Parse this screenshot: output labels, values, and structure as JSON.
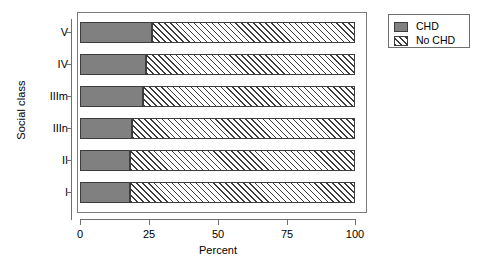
{
  "chart_data": {
    "type": "bar",
    "orientation": "horizontal",
    "stacked": true,
    "stack_mode": "percent",
    "title": "",
    "xlabel": "Percent",
    "ylabel": "Social class",
    "categories": [
      "I",
      "II",
      "IIIn",
      "IIIm",
      "IV",
      "V"
    ],
    "categories_top_to_bottom": [
      "V",
      "IV",
      "IIIm",
      "IIIn",
      "II",
      "I"
    ],
    "series": [
      {
        "name": "CHD",
        "values": [
          18,
          18,
          19,
          23,
          24,
          26
        ]
      },
      {
        "name": "No CHD",
        "values": [
          82,
          82,
          81,
          77,
          76,
          74
        ]
      }
    ],
    "xlim": [
      0,
      100
    ],
    "xticks": [
      0,
      25,
      50,
      75,
      100
    ],
    "xtick_labels": [
      "0",
      "25",
      "50",
      "75",
      "100"
    ],
    "grid": false,
    "legend_position": "right-top",
    "colors": {
      "chd": "#808080",
      "no_chd": "#ffffff",
      "hatch": "#3c3c3c",
      "axis": "#6f6f6f",
      "border": "#3c3c3c",
      "background": "#ffffff"
    }
  },
  "legend": {
    "entries": [
      {
        "label": "CHD",
        "fill": "solid"
      },
      {
        "label": "No CHD",
        "fill": "hatch"
      }
    ]
  }
}
